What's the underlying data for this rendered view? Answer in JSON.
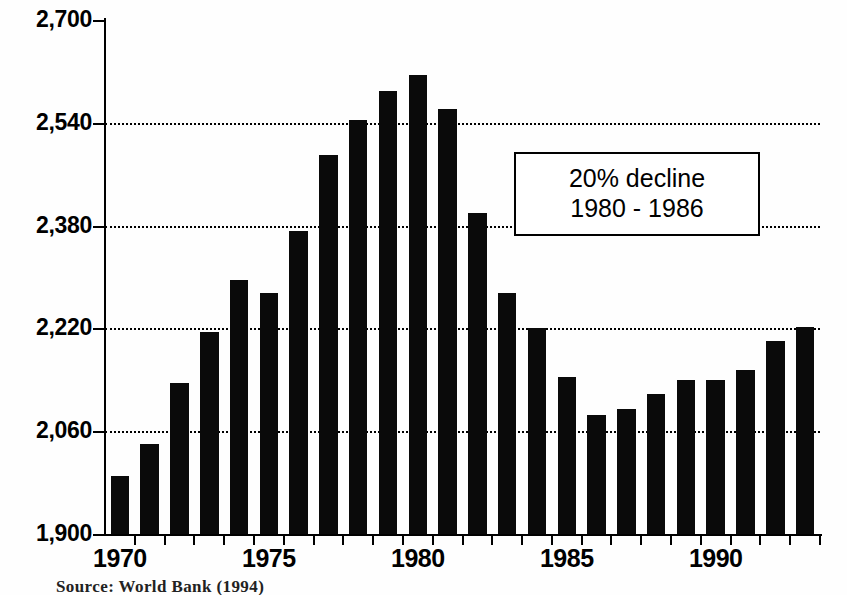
{
  "chart_data": {
    "type": "bar",
    "title": "",
    "subtitle": "",
    "xlabel": "",
    "ylabel": "",
    "ylim": [
      1900,
      2700
    ],
    "ytick_values": [
      1900,
      2060,
      2220,
      2380,
      2540,
      2700
    ],
    "ytick_labels": [
      "1,900",
      "2,060",
      "2,220",
      "2,380",
      "2,540",
      "2,700"
    ],
    "xtick_labels": [
      "1970",
      "1975",
      "1980",
      "1985",
      "1990"
    ],
    "xtick_years": [
      1970,
      1975,
      1980,
      1985,
      1990
    ],
    "grid": "horizontal-dotted",
    "legend": "none",
    "bar_color": "#0a0a0a",
    "categories": [
      1970,
      1971,
      1972,
      1973,
      1974,
      1975,
      1976,
      1977,
      1978,
      1979,
      1980,
      1981,
      1982,
      1983,
      1984,
      1985,
      1986,
      1987,
      1988,
      1989,
      1990,
      1991,
      1992,
      1993
    ],
    "values": [
      1990,
      2040,
      2135,
      2215,
      2295,
      2275,
      2372,
      2490,
      2545,
      2590,
      2615,
      2562,
      2400,
      2275,
      2220,
      2145,
      2085,
      2095,
      2118,
      2140,
      2140,
      2155,
      2200,
      2222
    ],
    "annotations": [
      {
        "name": "decline-callout",
        "line1": "20% decline",
        "line2": "1980 - 1986"
      }
    ]
  },
  "annotation_box": {
    "line1": "20% decline",
    "line2": "1980 - 1986"
  },
  "footer": {
    "source": "Source: World Bank (1994)"
  }
}
